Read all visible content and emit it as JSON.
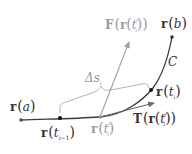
{
  "diagram": {
    "colors": {
      "curve": "#3a3a3a",
      "points": "#222222",
      "force_arrow": "#a0a0a0",
      "tangent_arrow": "#6a6a6a",
      "brace": "#a8a8a8",
      "dark_text": "#333333",
      "gray_text": "#9a9a9a"
    },
    "curve_label": "C",
    "points": [
      {
        "id": "r_a",
        "label_main": "r",
        "label_arg": "a",
        "label_sub": ""
      },
      {
        "id": "r_tim1",
        "label_main": "r",
        "label_arg": "t",
        "label_sub": "i−1"
      },
      {
        "id": "r_tistar",
        "label_main": "r",
        "label_arg": "t",
        "label_sub": "i",
        "label_sup": "*"
      },
      {
        "id": "r_ti",
        "label_main": "r",
        "label_arg": "t",
        "label_sub": "i"
      },
      {
        "id": "r_b",
        "label_main": "r",
        "label_arg": "b",
        "label_sub": ""
      }
    ],
    "vectors": {
      "force": {
        "label_prefix": "F",
        "label_inner": "r",
        "label_arg": "t",
        "label_sub": "i",
        "label_sup": "*"
      },
      "tangent": {
        "label_prefix": "T",
        "label_inner": "r",
        "label_arg": "t",
        "label_sub": "i",
        "label_sup": "*"
      }
    },
    "arc_length": {
      "symbol": "Δs",
      "sub": "i"
    },
    "parens": {
      "open": "(",
      "close": ")"
    }
  }
}
